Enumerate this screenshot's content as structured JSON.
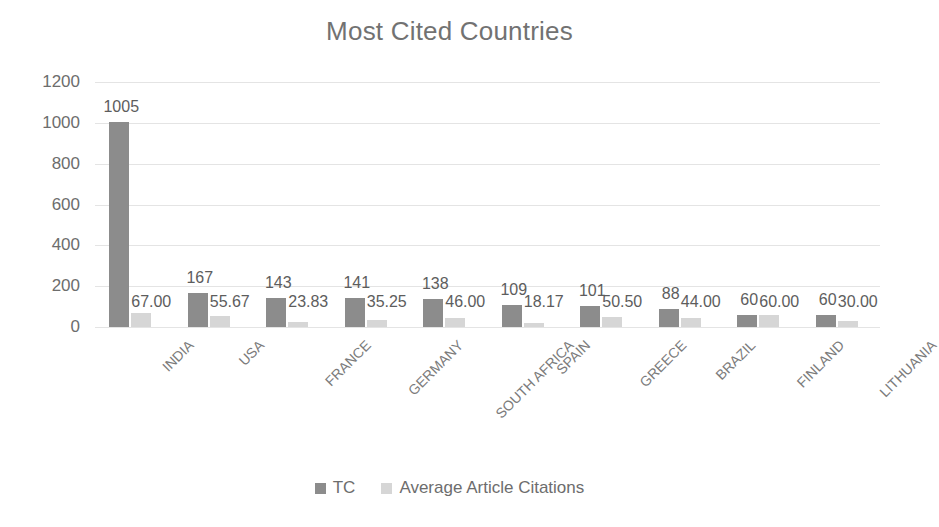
{
  "chart_data": {
    "type": "bar",
    "title": "Most Cited Countries",
    "xlabel": "",
    "ylabel": "",
    "ylim": [
      0,
      1200
    ],
    "yticks": [
      0,
      200,
      400,
      600,
      800,
      1000,
      1200
    ],
    "ytick_labels": [
      "0",
      "200",
      "400",
      "600",
      "800",
      "1000",
      "1200"
    ],
    "grid": true,
    "legend_position": "bottom",
    "categories": [
      "INDIA",
      "USA",
      "FRANCE",
      "GERMANY",
      "SOUTH AFRICA",
      "SPAIN",
      "GREECE",
      "BRAZIL",
      "FINLAND",
      "LITHUANIA"
    ],
    "series": [
      {
        "name": "TC",
        "color": "#8c8c8c",
        "values": [
          1005,
          167,
          143,
          141,
          138,
          109,
          101,
          88,
          60,
          60
        ],
        "labels": [
          "1005",
          "167",
          "143",
          "141",
          "138",
          "109",
          "101",
          "88",
          "60",
          "60"
        ]
      },
      {
        "name": "Average Article Citations",
        "color": "#d6d6d6",
        "values": [
          67.0,
          55.67,
          23.83,
          35.25,
          46.0,
          18.17,
          50.5,
          44.0,
          60.0,
          30.0
        ],
        "labels": [
          "67.00",
          "55.67",
          "23.83",
          "35.25",
          "46.00",
          "18.17",
          "50.50",
          "44.00",
          "60.00",
          "30.00"
        ]
      }
    ]
  },
  "legend": {
    "items": [
      {
        "label": "TC",
        "color": "#8c8c8c"
      },
      {
        "label": "Average Article Citations",
        "color": "#d6d6d6"
      }
    ]
  },
  "colors": {
    "series_tc": "#8c8c8c",
    "series_avg": "#d6d6d6",
    "gridline": "#e4e4e4",
    "text": "#6d6d6d",
    "title": "#727272"
  }
}
